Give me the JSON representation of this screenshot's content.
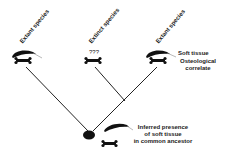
{
  "diagram": {
    "taxa": [
      {
        "label": "Extant species",
        "soft_tissue": true,
        "bone": true
      },
      {
        "label": "Extinct species",
        "unknown_marker": "???",
        "soft_tissue": false,
        "bone": true
      },
      {
        "label": "Extant species",
        "soft_tissue": true,
        "bone": true
      }
    ],
    "legend": {
      "soft_tissue": "Soft tissue",
      "osteological_line1": "Osteological",
      "osteological_line2": "correlate"
    },
    "ancestor": {
      "line1": "Inferred presence",
      "line2": "of soft tissue",
      "line3": "in common ancestor"
    },
    "colors": {
      "ink": "#111111",
      "background": "#ffffff"
    }
  }
}
